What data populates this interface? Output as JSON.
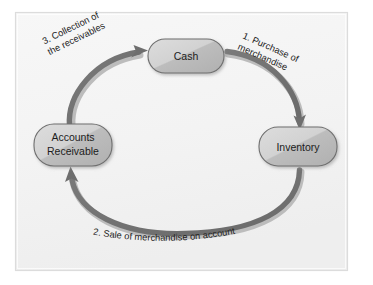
{
  "diagram": {
    "frame": {
      "background_color": "#f4f4f4",
      "border_color": "#d8d8d8",
      "outer_background_color": "#ffffff"
    },
    "style": {
      "node_fill_light": "#d5d5d5",
      "node_fill_dark": "#b5b5b5",
      "node_border_color": "#6f6f6f",
      "arrow_color": "#6e6e6e",
      "arrow_highlight_color": "#b9b9b9",
      "text_color": "#1c1c1c"
    },
    "nodes": [
      {
        "id": "cash",
        "label": "Cash",
        "lines": [
          "Cash"
        ]
      },
      {
        "id": "inventory",
        "label": "Inventory",
        "lines": [
          "Inventory"
        ]
      },
      {
        "id": "accounts-receivable",
        "label": "Accounts Receivable",
        "lines": [
          "Accounts",
          "Receivable"
        ]
      }
    ],
    "edges": [
      {
        "id": "purchase",
        "from": "cash",
        "to": "inventory",
        "step": "1.",
        "label": "1. Purchase of merchandise",
        "lines": [
          "1. Purchase of",
          "merchandise"
        ]
      },
      {
        "id": "sale",
        "from": "inventory",
        "to": "accounts-receivable",
        "step": "2.",
        "label": "2. Sale of merchandise on account",
        "lines": [
          "2. Sale of merchandise on account"
        ],
        "chars": [
          "2",
          ".",
          " ",
          "S",
          "a",
          "l",
          "e",
          " ",
          "o",
          "f",
          " ",
          "m",
          "e",
          "r",
          "c",
          "h",
          "a",
          "n",
          "d",
          "i",
          "s",
          "e",
          " ",
          "o",
          "n",
          " ",
          "a",
          "c",
          "c",
          "o",
          "u",
          "n",
          "t"
        ]
      },
      {
        "id": "collection",
        "from": "accounts-receivable",
        "to": "cash",
        "step": "3.",
        "label": "3. Collection of the receivables",
        "lines": [
          "3. Collection of",
          "the receivables"
        ]
      }
    ]
  }
}
